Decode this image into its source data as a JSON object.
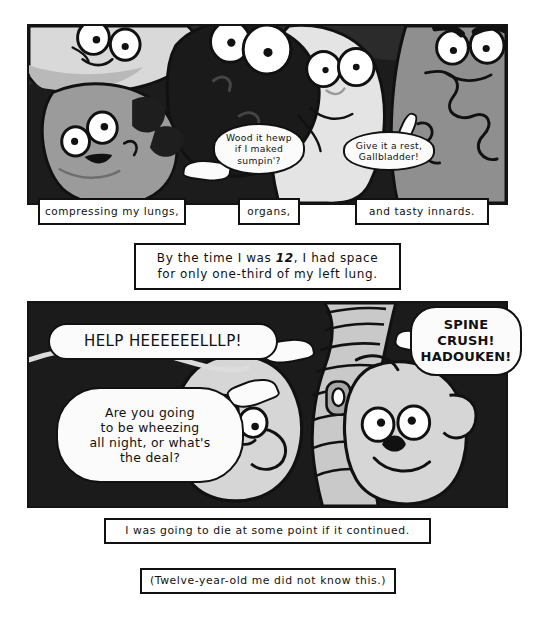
{
  "page": {
    "background_color": "#ffffff"
  },
  "panels": [
    {
      "id": "panel-1",
      "name": "crowded-organs-panel",
      "background_color": "#2b2b2b",
      "description": "Cartoon internal organs with googly eyes crowded together",
      "characters": [
        {
          "name": "lung-top-left",
          "fill": "#d8d8d8",
          "expression": "worried"
        },
        {
          "name": "liver-dark",
          "fill": "#1e1e1e",
          "expression": "staring"
        },
        {
          "name": "gallbladder",
          "fill": "#9a9a9a",
          "expression": "happy"
        },
        {
          "name": "stomach-pale",
          "fill": "#e3e3e3",
          "expression": "annoyed"
        },
        {
          "name": "intestines-right",
          "fill": "#8f8f8f",
          "expression": "angry"
        }
      ]
    },
    {
      "id": "panel-2",
      "name": "lungs-and-spine-panel",
      "background_color": "#1c1c1c",
      "description": "Two lungs squeezed against a curved spine",
      "characters": [
        {
          "name": "lung-left",
          "fill": "#d6d6d6",
          "expression": "distressed"
        },
        {
          "name": "lung-right",
          "fill": "#d6d6d6",
          "expression": "pained"
        },
        {
          "name": "spine",
          "fill": "#c9c9c9",
          "expression": "neutral"
        }
      ]
    }
  ],
  "balloons": [
    {
      "id": "bal-wood",
      "name": "balloon-gallbladder",
      "speaker": "gallbladder",
      "panel": "panel-1",
      "style": "round",
      "lines": [
        "Wood it hewp",
        "if I maked",
        "sumpin'?"
      ]
    },
    {
      "id": "bal-rest",
      "name": "balloon-stomach",
      "speaker": "stomach",
      "panel": "panel-1",
      "style": "round",
      "lines": [
        "Give it a rest,",
        "Gallbladder!"
      ]
    },
    {
      "id": "bal-help",
      "name": "balloon-help",
      "speaker": "lung-left",
      "panel": "panel-2",
      "style": "blob",
      "lines": [
        "HELP HEEEEEELLLP!"
      ]
    },
    {
      "id": "bal-wheezing",
      "name": "balloon-wheezing",
      "speaker": "lung-left",
      "panel": "panel-2",
      "style": "blob",
      "lines": [
        "Are you going",
        "to be wheezing",
        "all night, or what's",
        "the deal?"
      ]
    },
    {
      "id": "bal-spine",
      "name": "balloon-spine-crush",
      "speaker": "spine",
      "panel": "panel-2",
      "style": "blob",
      "lines": [
        "SPINE",
        "CRUSH!",
        "HADOUKEN!"
      ]
    }
  ],
  "captions": [
    {
      "id": "cap-lungs",
      "name": "caption-compressing-lungs",
      "lines": [
        "compressing my lungs,"
      ]
    },
    {
      "id": "cap-organs",
      "name": "caption-organs",
      "lines": [
        "organs,"
      ]
    },
    {
      "id": "cap-innards",
      "name": "caption-tasty-innards",
      "lines": [
        "and tasty innards."
      ]
    },
    {
      "id": "cap-bigtime",
      "name": "caption-by-the-time",
      "line_1_a": "By the time I was ",
      "line_1_em": "12",
      "line_1_b": ", I had space",
      "line_2": "for only one-third of my left lung."
    },
    {
      "id": "cap-die",
      "name": "caption-going-to-die",
      "lines": [
        "I was going to die at some point if it continued."
      ]
    },
    {
      "id": "cap-twelve",
      "name": "caption-twelve-year-old",
      "lines": [
        "(Twelve-year-old me did not know this.)"
      ]
    }
  ],
  "colors": {
    "ink": "#111111",
    "paper": "#ffffff",
    "panel1_bg": "#2b2b2b",
    "panel2_bg": "#1c1c1c",
    "organ_light": "#e3e3e3",
    "organ_mid": "#9a9a9a",
    "organ_dark": "#1e1e1e"
  }
}
